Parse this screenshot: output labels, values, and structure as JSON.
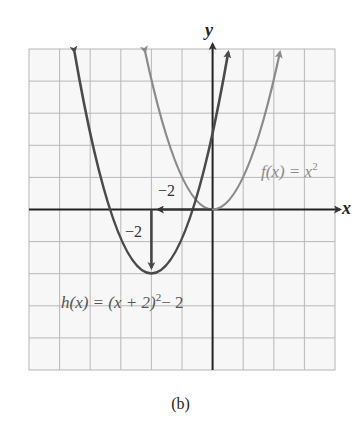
{
  "figure": {
    "caption": "(b)",
    "axes": {
      "x_label": "x",
      "y_label": "y",
      "x_range": [
        -6,
        4
      ],
      "y_range": [
        -5,
        5
      ],
      "grid": true
    },
    "functions": [
      {
        "name": "f",
        "label": "f(x) = x²",
        "expression": "x^2",
        "color": "#8a8a8a",
        "vertex": [
          0,
          0
        ]
      },
      {
        "name": "h",
        "label": "h(x) = (x + 2)² − 2",
        "expression": "(x+2)^2 - 2",
        "color": "#4a4a4a",
        "vertex": [
          -2,
          -2
        ]
      }
    ],
    "shift_annotations": [
      {
        "label": "−2",
        "direction": "horizontal",
        "from": [
          0,
          0
        ],
        "to": [
          -2,
          0
        ]
      },
      {
        "label": "−2",
        "direction": "vertical",
        "from": [
          -2,
          0
        ],
        "to": [
          -2,
          -2
        ]
      }
    ],
    "labels": {
      "f_name": "f",
      "f_rest": "(x) = x",
      "f_exp": "2",
      "h_name": "h",
      "h_rest": "(x) = (x + 2)",
      "h_exp": "2",
      "h_tail": "− 2",
      "shift_h": "−2",
      "shift_v": "−2",
      "x_axis": "x",
      "y_axis": "y"
    }
  }
}
